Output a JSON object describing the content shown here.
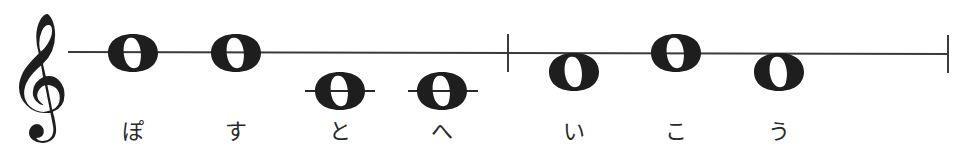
{
  "staff": {
    "color": "#3a3a3a",
    "line_start_x": 68,
    "line_end_x": 948,
    "line_y": 53,
    "clef": "treble-clef",
    "barlines": [
      {
        "x": 508,
        "y1": 34,
        "y2": 72
      },
      {
        "x": 948,
        "y1": 35,
        "y2": 73
      }
    ]
  },
  "notes": [
    {
      "type": "whole-note",
      "x": 133,
      "y": 53,
      "ledger": false,
      "lyric": "ぽ"
    },
    {
      "type": "whole-note",
      "x": 236,
      "y": 53,
      "ledger": false,
      "lyric": "す"
    },
    {
      "type": "whole-note",
      "x": 340,
      "y": 91,
      "ledger": true,
      "lyric": "と"
    },
    {
      "type": "whole-note",
      "x": 442,
      "y": 91,
      "ledger": true,
      "lyric": "へ"
    },
    {
      "type": "whole-note",
      "x": 574,
      "y": 72,
      "ledger": false,
      "lyric": "い"
    },
    {
      "type": "whole-note",
      "x": 676,
      "y": 53,
      "ledger": false,
      "lyric": "こ"
    },
    {
      "type": "whole-note",
      "x": 779,
      "y": 72,
      "ledger": false,
      "lyric": "う"
    }
  ],
  "lyrics": [
    "ぽ",
    "す",
    "と",
    "へ",
    "い",
    "こ",
    "う"
  ]
}
